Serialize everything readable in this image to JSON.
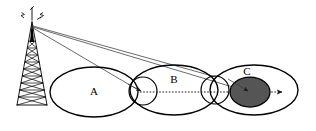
{
  "diagram": {
    "background_color": "#ffffff",
    "stroke_color": "#000000",
    "beam_color": "#3a3a3a",
    "node_fill_color": "#555555",
    "cells": [
      {
        "id": "cell-a",
        "label": "A",
        "label_x": 94,
        "label_y": 92,
        "cx": 94,
        "cy": 92,
        "rx": 44,
        "ry": 25
      },
      {
        "id": "cell-b",
        "label": "B",
        "label_x": 174,
        "label_y": 80,
        "cx": 174,
        "cy": 90,
        "rx": 44,
        "ry": 25
      },
      {
        "id": "cell-c",
        "label": "C",
        "label_x": 247,
        "label_y": 72,
        "cx": 254,
        "cy": 90,
        "rx": 44,
        "ry": 25
      }
    ],
    "handover_circles": [
      {
        "id": "handover-ab",
        "cx": 143,
        "cy": 91,
        "r": 14
      },
      {
        "id": "handover-bc",
        "cx": 215,
        "cy": 90,
        "r": 14
      }
    ],
    "mobile_node": {
      "id": "mobile-station",
      "cx": 250,
      "cy": 92,
      "rx": 20,
      "ry": 15,
      "fill": "#555555"
    },
    "tower": {
      "base_y": 105,
      "apex_x": 32,
      "apex_y": 27,
      "base_left_x": 16,
      "base_right_x": 48,
      "antenna_label": "transmitter-tower"
    },
    "beams": [
      {
        "id": "beam-to-handover-ab",
        "x1": 32,
        "y1": 28,
        "x2": 142,
        "y2": 92
      },
      {
        "id": "beam-to-mobile-node",
        "x1": 32,
        "y1": 28,
        "x2": 248,
        "y2": 92
      },
      {
        "id": "beam-upper-edge",
        "x1": 32,
        "y1": 26,
        "x2": 216,
        "y2": 78
      }
    ],
    "trajectory": {
      "id": "movement-path",
      "x1": 140,
      "y1": 92,
      "x2": 286,
      "y2": 92,
      "style": "dotted",
      "direction": "left-to-right"
    }
  }
}
